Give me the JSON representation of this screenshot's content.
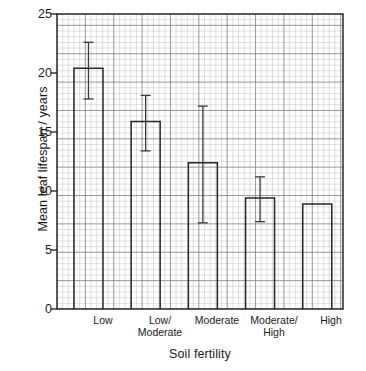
{
  "chart_data": {
    "type": "bar",
    "title": "",
    "xlabel": "Soil fertility",
    "ylabel": "Mean leaf lifespan / years",
    "categories": [
      "Low",
      "Low/\nModerate",
      "Moderate",
      "Moderate/\nHigh",
      "High"
    ],
    "category_lines": [
      [
        "Low"
      ],
      [
        "Low/",
        "Moderate"
      ],
      [
        "Moderate"
      ],
      [
        "Moderate/",
        "High"
      ],
      [
        "High"
      ]
    ],
    "values": [
      20.4,
      15.9,
      12.4,
      9.4,
      8.9
    ],
    "error_low": [
      17.8,
      13.4,
      7.3,
      7.4,
      null
    ],
    "error_high": [
      22.6,
      18.1,
      17.2,
      11.2,
      null
    ],
    "ylim": [
      0,
      25
    ],
    "ytick_labels": [
      "0",
      "5",
      "10",
      "15",
      "20",
      "25"
    ],
    "ytick_values": [
      0,
      5,
      10,
      15,
      20,
      25
    ],
    "grid": "graph-paper-minor-and-major",
    "legend": "none",
    "bar_fill": "none",
    "bar_stroke": "#262626",
    "grid_minor_color": "#b9b9b9",
    "grid_major_color": "#7d7d7d",
    "axis_color": "#1a1a1a",
    "background": "#ffffff"
  }
}
